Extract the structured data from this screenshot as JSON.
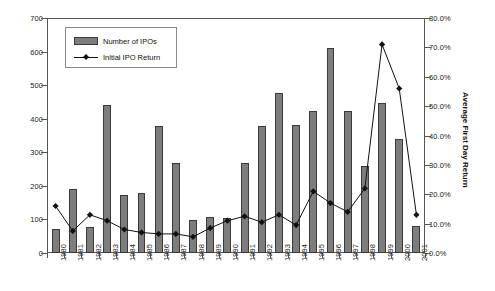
{
  "chart_data": {
    "type": "bar",
    "title": "",
    "xlabel": "",
    "ylabel": "",
    "grid": false,
    "legend_position": "top-left",
    "categories": [
      "1980",
      "1981",
      "1982",
      "1983",
      "1984",
      "1985",
      "1986",
      "1987",
      "1988",
      "1989",
      "1990",
      "1991",
      "1992",
      "1993",
      "1994",
      "1995",
      "1996",
      "1997",
      "1998",
      "1999",
      "2000",
      "2001"
    ],
    "axes": {
      "left": {
        "label": "",
        "ylim": [
          0,
          700
        ],
        "ticks": [
          0,
          100,
          200,
          300,
          400,
          500,
          600,
          700
        ],
        "tick_labels": [
          "0",
          "100",
          "200",
          "300",
          "400",
          "500",
          "600",
          "700"
        ]
      },
      "right": {
        "label": "Average First Day Return",
        "ylim": [
          0,
          80
        ],
        "ticks": [
          0,
          10,
          20,
          30,
          40,
          50,
          60,
          70,
          80
        ],
        "tick_labels": [
          "0.0%",
          "10.0%",
          "20.0%",
          "30.0%",
          "40.0%",
          "50.0%",
          "60.0%",
          "70.0%",
          "80.0%"
        ]
      }
    },
    "series": [
      {
        "name": "Number of IPOs",
        "type": "bar",
        "axis": "left",
        "color": "#7d7d7d",
        "values": [
          71,
          192,
          77,
          442,
          172,
          179,
          378,
          268,
          98,
          106,
          103,
          268,
          378,
          478,
          380,
          422,
          612,
          422,
          258,
          448,
          341,
          80
        ]
      },
      {
        "name": "Initial IPO Return",
        "type": "line",
        "axis": "right",
        "color": "#111111",
        "values": [
          16.0,
          7.5,
          13.0,
          11.0,
          8.0,
          7.0,
          6.5,
          6.5,
          5.5,
          8.5,
          11.0,
          12.5,
          10.5,
          13.0,
          9.5,
          21.0,
          17.0,
          14.0,
          22.0,
          71.0,
          56.0,
          13.0
        ]
      }
    ]
  },
  "legend": {
    "items": [
      {
        "label": "Number of IPOs",
        "marker": "bar-swatch"
      },
      {
        "label": "Initial IPO Return",
        "marker": "line-diamond"
      }
    ]
  }
}
